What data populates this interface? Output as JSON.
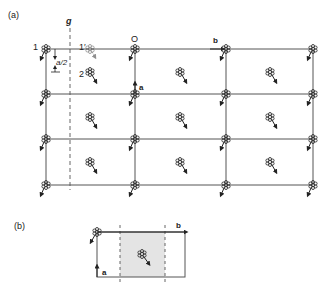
{
  "panel_a": {
    "label": "(a)",
    "glide_label": "g",
    "origin_label": "O",
    "atom1_label": "1",
    "atom1p_label": "1′",
    "atom2_label": "2",
    "vec_a_label": "a",
    "vec_b_label": "b",
    "offset_label": "a/2",
    "grid_cols_x": [
      46,
      135,
      226,
      313
    ],
    "grid_rows_y": [
      49,
      94,
      139,
      185
    ],
    "interior_cols_x": [
      90,
      180,
      270
    ],
    "interior_rows_y": [
      72,
      117,
      162
    ],
    "glide_x": 70
  },
  "panel_b": {
    "label": "(b)",
    "vec_a_label": "a",
    "vec_b_label": "b"
  },
  "colors": {
    "line": "#555555",
    "shade": "#e4e4e4",
    "ink": "#222222"
  },
  "icons": {
    "atom": "rosette-atom-icon",
    "moment": "arrow-moment-icon"
  }
}
